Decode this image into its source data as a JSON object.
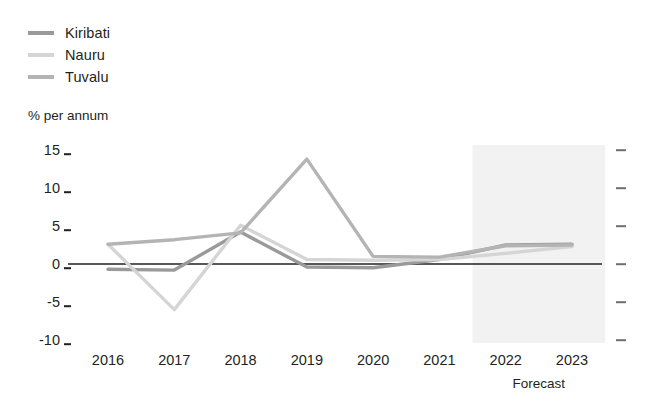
{
  "legend": {
    "position": "top-left",
    "entries": [
      {
        "label": "Kiribati",
        "color": "#9a9a9a"
      },
      {
        "label": "Nauru",
        "color": "#d5d5d5"
      },
      {
        "label": "Tuvalu",
        "color": "#b4b4b4"
      }
    ]
  },
  "axis": {
    "unit_label": "% per annum",
    "y_ticks": [
      "15",
      "10",
      "5",
      "0",
      "-5",
      "-10"
    ],
    "y_values": [
      15,
      10,
      5,
      0,
      -5,
      -10
    ],
    "x_ticks": [
      "2016",
      "2017",
      "2018",
      "2019",
      "2020",
      "2021",
      "2022",
      "2023"
    ]
  },
  "forecast": {
    "caption": "Forecast",
    "start_year": "2022",
    "end_year": "2023",
    "band_color": "#f2f2f2"
  },
  "colors": {
    "kiribati": "#9a9a9a",
    "nauru": "#d5d5d5",
    "tuvalu": "#b4b4b4",
    "zero_line": "#231f20",
    "tick": "#231f20",
    "tick_right": "#6f6f6f",
    "background": "#ffffff"
  },
  "chart_data": {
    "type": "line",
    "title": "",
    "subtitle": "",
    "xlabel": "",
    "ylabel": "% per annum",
    "x": [
      "2016",
      "2017",
      "2018",
      "2019",
      "2020",
      "2021",
      "2022",
      "2023"
    ],
    "categories": [
      "2016",
      "2017",
      "2018",
      "2019",
      "2020",
      "2021",
      "2022",
      "2023"
    ],
    "ylim": [
      -10,
      15
    ],
    "xlim": [
      "2016",
      "2023"
    ],
    "grid": false,
    "zero_line": true,
    "legend_position": "top-left",
    "annotations": [
      {
        "text": "Forecast",
        "x_from": "2022",
        "x_to": "2023",
        "type": "shaded-band"
      }
    ],
    "series": [
      {
        "name": "Kiribati",
        "color": "#9a9a9a",
        "values": [
          -0.7,
          -0.8,
          4.2,
          -0.4,
          -0.5,
          0.6,
          2.5,
          2.6
        ]
      },
      {
        "name": "Nauru",
        "color": "#d5d5d5",
        "values": [
          2.6,
          -6.0,
          5.1,
          0.6,
          0.5,
          0.6,
          1.4,
          2.3
        ]
      },
      {
        "name": "Tuvalu",
        "color": "#b4b4b4",
        "values": [
          2.6,
          3.2,
          4.1,
          13.8,
          1.0,
          0.9,
          2.4,
          2.5
        ]
      }
    ]
  }
}
